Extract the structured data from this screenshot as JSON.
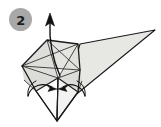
{
  "figure": {
    "kind": "origami-fold-diagram",
    "step": {
      "label": "2",
      "badge_fill": "#a8a8a8",
      "badge_text_color": "#1c1c1c",
      "badge_center": [
        20.5,
        19.5
      ],
      "badge_radius": 11.5
    },
    "colors": {
      "background": "#ffffff",
      "paper_light": "#e9e9e7",
      "paper_mid": "#dededa",
      "paper_dark": "#d2d2ce",
      "paper_white": "#fbfbfb",
      "outline": "#1a1a1a",
      "crease": "#4a4a4a",
      "arrow": "#111111"
    },
    "shapes": {
      "big_triangle": "80,44 155,30 62,106",
      "kite_left_panel": "22,66 47,40 58,78 36,90",
      "kite_right_panel": "58,78 47,40 78,44 80,70",
      "kite_upper_band": "22,66 47,40 78,44 80,70",
      "lower_left_flap": "22,66 58,78 36,92 24,82",
      "lower_right_flap": "80,70 58,78 78,92 82,82",
      "bottom_spike_left": "36,90 58,78 57,121",
      "bottom_spike_right": "78,92 58,78 57,121"
    },
    "creases": [
      "22,66 80,70",
      "47,40 58,78",
      "78,44 58,78",
      "22,66 58,78",
      "80,70 58,78",
      "47,40 80,70",
      "78,44 22,66"
    ],
    "outlines": [
      "22,66 47,40 78,44 80,70 57,121 22,66"
    ],
    "arrows": {
      "up_arrow": {
        "name": "unfold-up-arrow",
        "shaft": "M 60,74 C 54,58 50,40 50,22",
        "head_tip": [
          50,
          14
        ],
        "direction": "up"
      },
      "left_inward_arrow": {
        "name": "fold-inward-arrow-left",
        "shaft": "M 29,95 C 33,85 45,83 54,88",
        "head_tip": [
          57,
          90
        ],
        "direction": "right"
      },
      "right_inward_arrow": {
        "name": "fold-inward-arrow-right",
        "shaft": "M 84,95 C 80,85 69,83 61,88",
        "head_tip": [
          58,
          90
        ],
        "direction": "left"
      }
    }
  }
}
